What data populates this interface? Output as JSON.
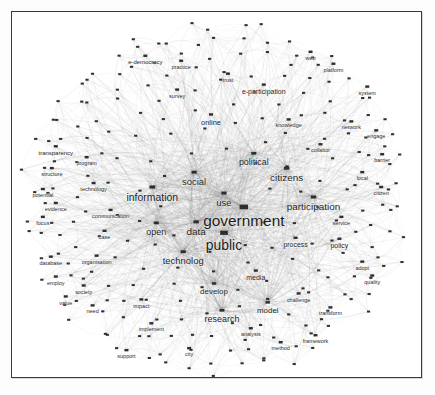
{
  "figure": {
    "type": "network-graph",
    "background_color": "#ffffff",
    "frame_color": "#3a3a3a",
    "node_color": "#2e2e2e",
    "edge_color": "#7b7b7b",
    "label_color": "#1c1c1c"
  },
  "chart_data": {
    "type": "scatter",
    "xlabel": "",
    "ylabel": "",
    "grid": false,
    "legend": "none",
    "xlim": [
      0,
      411
    ],
    "ylim": [
      0,
      367
    ],
    "nodes": [
      {
        "id": "government",
        "x": 233,
        "y": 196,
        "size": 15.5,
        "label": "government"
      },
      {
        "id": "public",
        "x": 213,
        "y": 222,
        "size": 14.0,
        "label": "public"
      },
      {
        "id": "information",
        "x": 141,
        "y": 176,
        "size": 10.5,
        "label": "information"
      },
      {
        "id": "participation",
        "x": 303,
        "y": 186,
        "size": 10.0,
        "label": "participation"
      },
      {
        "id": "citizens",
        "x": 276,
        "y": 157,
        "size": 10.0,
        "label": "citizens"
      },
      {
        "id": "data",
        "x": 185,
        "y": 211,
        "size": 10.0,
        "label": "data"
      },
      {
        "id": "social",
        "x": 183,
        "y": 161,
        "size": 9.5,
        "label": "social"
      },
      {
        "id": "use",
        "x": 213,
        "y": 182,
        "size": 9.5,
        "label": "use"
      },
      {
        "id": "technolog",
        "x": 172,
        "y": 241,
        "size": 9.5,
        "label": "technolog"
      },
      {
        "id": "political",
        "x": 243,
        "y": 142,
        "size": 9.0,
        "label": "political"
      },
      {
        "id": "open",
        "x": 145,
        "y": 212,
        "size": 9.0,
        "label": "open"
      },
      {
        "id": "research",
        "x": 211,
        "y": 300,
        "size": 9.0,
        "label": "research"
      },
      {
        "id": "develop",
        "x": 203,
        "y": 273,
        "size": 8.0,
        "label": "develop"
      },
      {
        "id": "model",
        "x": 257,
        "y": 292,
        "size": 8.0,
        "label": "model"
      },
      {
        "id": "media",
        "x": 245,
        "y": 260,
        "size": 7.0,
        "label": "media"
      },
      {
        "id": "process",
        "x": 285,
        "y": 227,
        "size": 7.0,
        "label": "process"
      },
      {
        "id": "policy",
        "x": 329,
        "y": 228,
        "size": 7.0,
        "label": "policy"
      },
      {
        "id": "e-participation",
        "x": 253,
        "y": 73,
        "size": 7.0,
        "label": "e-participation"
      },
      {
        "id": "e-democracy",
        "x": 134,
        "y": 44,
        "size": 6.0,
        "label": "e-democracy"
      },
      {
        "id": "online",
        "x": 200,
        "y": 103,
        "size": 7.5,
        "label": "online"
      },
      {
        "id": "transparency",
        "x": 44,
        "y": 135,
        "size": 6.0,
        "label": "transparency"
      },
      {
        "id": "structure",
        "x": 40,
        "y": 157,
        "size": 5.5,
        "label": "structure"
      },
      {
        "id": "potential",
        "x": 31,
        "y": 178,
        "size": 5.5,
        "label": "potential"
      },
      {
        "id": "evidence",
        "x": 44,
        "y": 192,
        "size": 5.5,
        "label": "evidence"
      },
      {
        "id": "focus",
        "x": 31,
        "y": 206,
        "size": 5.5,
        "label": "focus"
      },
      {
        "id": "program",
        "x": 75,
        "y": 146,
        "size": 5.5,
        "label": "program"
      },
      {
        "id": "technology2",
        "x": 82,
        "y": 172,
        "size": 5.5,
        "label": "technology"
      },
      {
        "id": "communication",
        "x": 99,
        "y": 199,
        "size": 5.5,
        "label": "communication"
      },
      {
        "id": "database",
        "x": 39,
        "y": 246,
        "size": 5.5,
        "label": "database"
      },
      {
        "id": "organisation",
        "x": 85,
        "y": 245,
        "size": 5.5,
        "label": "organisation"
      },
      {
        "id": "employ",
        "x": 44,
        "y": 266,
        "size": 5.5,
        "label": "employ"
      },
      {
        "id": "society",
        "x": 72,
        "y": 275,
        "size": 5.5,
        "label": "society"
      },
      {
        "id": "value",
        "x": 54,
        "y": 286,
        "size": 5.5,
        "label": "value"
      },
      {
        "id": "need",
        "x": 81,
        "y": 295,
        "size": 5.5,
        "label": "need"
      },
      {
        "id": "implement",
        "x": 140,
        "y": 313,
        "size": 5.5,
        "label": "implement"
      },
      {
        "id": "support",
        "x": 115,
        "y": 340,
        "size": 5.5,
        "label": "support"
      },
      {
        "id": "challenge",
        "x": 288,
        "y": 283,
        "size": 5.5,
        "label": "challenge"
      },
      {
        "id": "transform",
        "x": 320,
        "y": 297,
        "size": 5.5,
        "label": "transform"
      },
      {
        "id": "service",
        "x": 331,
        "y": 206,
        "size": 5.5,
        "label": "service"
      },
      {
        "id": "quality",
        "x": 362,
        "y": 265,
        "size": 5.5,
        "label": "quality"
      },
      {
        "id": "adopt",
        "x": 352,
        "y": 251,
        "size": 5.5,
        "label": "adopt"
      },
      {
        "id": "network",
        "x": 341,
        "y": 110,
        "size": 5.5,
        "label": "network"
      },
      {
        "id": "system",
        "x": 357,
        "y": 75,
        "size": 5.5,
        "label": "system"
      },
      {
        "id": "barrier",
        "x": 372,
        "y": 143,
        "size": 5.5,
        "label": "barrier"
      },
      {
        "id": "citizen2",
        "x": 371,
        "y": 176,
        "size": 5.5,
        "label": "citizen"
      },
      {
        "id": "local",
        "x": 352,
        "y": 161,
        "size": 5.5,
        "label": "local"
      },
      {
        "id": "engage",
        "x": 366,
        "y": 119,
        "size": 5.5,
        "label": "engage"
      },
      {
        "id": "platform",
        "x": 323,
        "y": 52,
        "size": 5.5,
        "label": "platform"
      },
      {
        "id": "web",
        "x": 300,
        "y": 40,
        "size": 5.5,
        "label": "web"
      },
      {
        "id": "practice",
        "x": 170,
        "y": 49,
        "size": 5.5,
        "label": "practice"
      },
      {
        "id": "survey",
        "x": 166,
        "y": 78,
        "size": 5.5,
        "label": "survey"
      },
      {
        "id": "trust",
        "x": 217,
        "y": 62,
        "size": 5.5,
        "label": "trust"
      },
      {
        "id": "knowledge",
        "x": 278,
        "y": 108,
        "size": 5.5,
        "label": "knowledge"
      },
      {
        "id": "collabor",
        "x": 310,
        "y": 133,
        "size": 5.5,
        "label": "collabor"
      },
      {
        "id": "analysis",
        "x": 240,
        "y": 318,
        "size": 5.5,
        "label": "analysis"
      },
      {
        "id": "method",
        "x": 270,
        "y": 332,
        "size": 5.5,
        "label": "method"
      },
      {
        "id": "framework",
        "x": 305,
        "y": 325,
        "size": 5.5,
        "label": "framework"
      },
      {
        "id": "city",
        "x": 178,
        "y": 338,
        "size": 5.5,
        "label": "city"
      },
      {
        "id": "case",
        "x": 93,
        "y": 220,
        "size": 5.5,
        "label": "case"
      },
      {
        "id": "impact",
        "x": 130,
        "y": 289,
        "size": 5.5,
        "label": "impact"
      }
    ]
  }
}
